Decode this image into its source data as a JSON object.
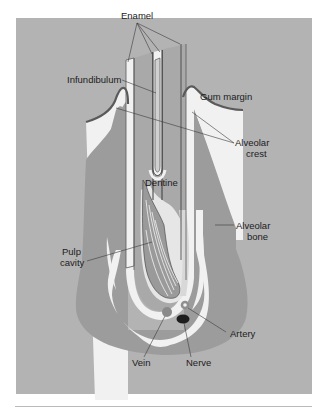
{
  "figure": {
    "colors": {
      "background": "#b3b3b3",
      "bone": "#9c9c9c",
      "dentine": "#a9a9a9",
      "white_tissue": "#f1f1f1",
      "gum_margin": "#5a5a5a",
      "vein": "#8a8a8a",
      "nerve": "#1e1e1e",
      "artery": "#8f8f8f",
      "leader_line": "#3a3a3a"
    },
    "labels": {
      "enamel": "Enamel",
      "infundibulum": "Infundibulum",
      "gum_margin": "Gum margin",
      "alveolar_crest_1": "Alveolar",
      "alveolar_crest_2": "crest",
      "dentine": "Dentine",
      "alveolar_bone_1": "Alveolar",
      "alveolar_bone_2": "bone",
      "pulp_cavity_1": "Pulp",
      "pulp_cavity_2": "cavity",
      "artery": "Artery",
      "vein": "Vein",
      "nerve": "Nerve"
    }
  }
}
